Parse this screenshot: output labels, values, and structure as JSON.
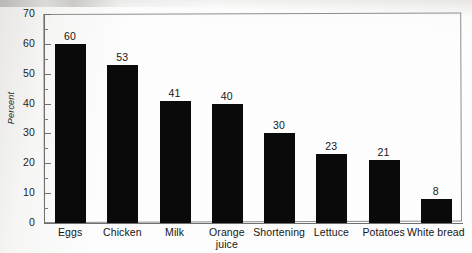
{
  "chart_data": {
    "type": "bar",
    "title": "",
    "xlabel": "",
    "ylabel": "Percent",
    "ylim": [
      0,
      70
    ],
    "ytick_step": 10,
    "yminor_step": 5,
    "grid": false,
    "legend": null,
    "orientation": "vertical",
    "bar_color": "#0a0a0a",
    "categories": [
      "Eggs",
      "Chicken",
      "Milk",
      "Orange juice",
      "Shortening",
      "Lettuce",
      "Potatoes",
      "White bread"
    ],
    "values": [
      60,
      53,
      41,
      40,
      30,
      23,
      21,
      8
    ],
    "ytick_labels": [
      "70",
      "60",
      "50",
      "40",
      "30",
      "20",
      "10",
      "0"
    ],
    "data_labels": [
      "60",
      "53",
      "41",
      "40",
      "30",
      "23",
      "21",
      "8"
    ],
    "points": [
      {
        "category": "Eggs",
        "line1": "Eggs",
        "line2": "",
        "value": 60,
        "label": "60"
      },
      {
        "category": "Chicken",
        "line1": "Chicken",
        "line2": "",
        "value": 53,
        "label": "53"
      },
      {
        "category": "Milk",
        "line1": "Milk",
        "line2": "",
        "value": 41,
        "label": "41"
      },
      {
        "category": "Orange juice",
        "line1": "Orange",
        "line2": "juice",
        "value": 40,
        "label": "40"
      },
      {
        "category": "Shortening",
        "line1": "Shortening",
        "line2": "",
        "value": 30,
        "label": "30"
      },
      {
        "category": "Lettuce",
        "line1": "Lettuce",
        "line2": "",
        "value": 23,
        "label": "23"
      },
      {
        "category": "Potatoes",
        "line1": "Potatoes",
        "line2": "",
        "value": 21,
        "label": "21"
      },
      {
        "category": "White bread",
        "line1": "White bread",
        "line2": "",
        "value": 8,
        "label": "8"
      }
    ]
  }
}
